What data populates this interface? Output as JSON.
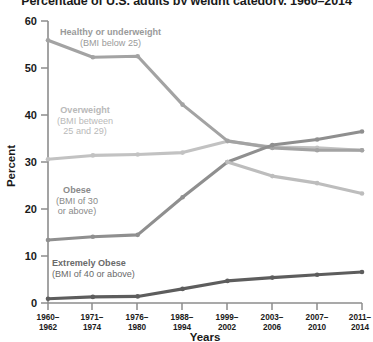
{
  "chart_data": {
    "type": "line",
    "title": "Percentage of U.S. adults by weight category, 1960–2014",
    "xlabel": "Years",
    "ylabel": "Percent",
    "ylim": [
      0,
      60
    ],
    "yticks": [
      0,
      10,
      20,
      30,
      40,
      50,
      60
    ],
    "grid": false,
    "legend": "inline-annotations",
    "categories": [
      "1960–1962",
      "1971–1974",
      "1976–1980",
      "1988–1994",
      "1999–2002",
      "2003–2006",
      "2007–2010",
      "2011–2014"
    ],
    "category_lines": [
      [
        "1960–",
        "1962"
      ],
      [
        "1971–",
        "1974"
      ],
      [
        "1976–",
        "1980"
      ],
      [
        "1988–",
        "1994"
      ],
      [
        "1999–",
        "2002"
      ],
      [
        "2003–",
        "2006"
      ],
      [
        "2007–",
        "2010"
      ],
      [
        "2011–",
        "2014"
      ]
    ],
    "series": [
      {
        "name": "Healthy or underweight",
        "label_head": "Healthy or underweight",
        "label_sub": "(BMI below 25)",
        "color": "#a3a3a3",
        "values": [
          55.9,
          52.3,
          52.5,
          42.2,
          34.5,
          33.0,
          32.5,
          32.5
        ]
      },
      {
        "name": "Overweight",
        "label_head": "Overweight",
        "label_sub": "(BMI between 25 and 29)",
        "label_sub_lines": [
          "(BMI between",
          "25 and 29)"
        ],
        "color": "#c2c2c2",
        "values": [
          30.6,
          31.4,
          31.6,
          32.0,
          34.4,
          33.2,
          33.0,
          32.5
        ]
      },
      {
        "name": "Obese",
        "label_head": "Obese",
        "label_sub": "(BMI of 30 or above)",
        "label_sub_lines": [
          "(BMI of 30",
          "or above)"
        ],
        "color": "#8f8f8f",
        "values": [
          13.4,
          14.1,
          14.5,
          22.5,
          30.0,
          33.6,
          34.8,
          36.5
        ]
      },
      {
        "name": "Extremely Obese",
        "label_head": "Extremely Obese",
        "label_sub": "(BMI of 40 or above)",
        "color": "#5d5d5d",
        "values": [
          0.9,
          1.3,
          1.4,
          3.0,
          4.7,
          5.4,
          6.0,
          6.6
        ]
      }
    ],
    "crossover_note": "Obese line overtakes Healthy and Overweight near 1999–2002 at about 30 percent",
    "second_branch": {
      "name": "Healthy or underweight continuing",
      "color": "#bdbdbd",
      "values_from_crossover": [
        30.0,
        27.0,
        25.5,
        23.3
      ]
    }
  },
  "axis": {
    "y_title": "Percent",
    "x_title": "Years"
  }
}
